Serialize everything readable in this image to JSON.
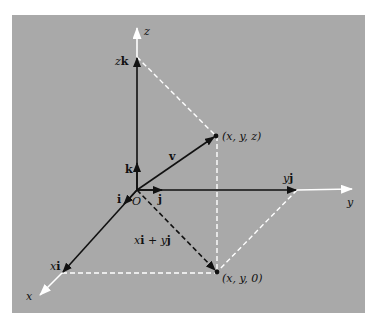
{
  "diagram": {
    "background_color": "#a9a9a9",
    "axis_color": "#ffffff",
    "vector_color": "#111111",
    "axes": {
      "x": {
        "label": "x"
      },
      "y": {
        "label": "y"
      },
      "z": {
        "label": "z"
      }
    },
    "origin": {
      "label": "O"
    },
    "unit_vectors": {
      "i": "i",
      "j": "j",
      "k": "k"
    },
    "components": {
      "xi": {
        "coef": "x",
        "unit": "i"
      },
      "yj": {
        "coef": "y",
        "unit": "j"
      },
      "zk": {
        "coef": "z",
        "unit": "k"
      }
    },
    "vector": {
      "label": "v"
    },
    "sum_label": {
      "x": "x",
      "i": "i",
      "plus": " + ",
      "y": "y",
      "j": "j"
    },
    "points": {
      "xyz": "(x, y, z)",
      "xy0": "(x, y, 0)"
    }
  }
}
